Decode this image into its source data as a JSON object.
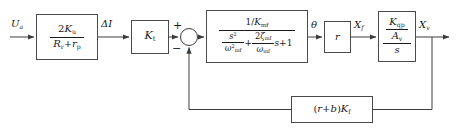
{
  "diagram": {
    "line_color": "#3c3c3c",
    "block_border_color": "#4a4a4a",
    "background": "#ffffff",
    "signals": {
      "input": "U",
      "input_sub": "a",
      "after_first_gain": "ΔI",
      "after_transfer": "θ",
      "after_r": "X",
      "after_r_sub": "f",
      "output": "X",
      "output_sub": "v"
    },
    "summing_junction": {
      "name": "summing-junction",
      "plus_sign": "+",
      "minus_sign": "−"
    },
    "blocks": {
      "gain_ku": {
        "numerator_coeff": "2",
        "numerator_symbol": "K",
        "numerator_sub": "u",
        "den_first_symbol": "R",
        "den_first_sub": "r",
        "den_operator": "+",
        "den_second_symbol": "r",
        "den_second_sub": "p"
      },
      "gain_kt": {
        "symbol": "K",
        "sub": "t"
      },
      "transfer": {
        "numerator_lead": "1/",
        "numerator_symbol": "K",
        "numerator_sub": "mf",
        "den_term1_num": "s",
        "den_term1_num_sup": "2",
        "den_term1_den_symbol": "ω",
        "den_term1_den_sup": "2",
        "den_term1_den_sub": "mf",
        "den_op1": "+",
        "den_term2_num_coeff": "2",
        "den_term2_num_symbol": "ζ",
        "den_term2_num_sub": "mf",
        "den_term2_den_symbol": "ω",
        "den_term2_den_sub": "mf",
        "den_term2_tail": "s",
        "den_op2": "+",
        "den_term3": "1"
      },
      "gain_r": {
        "symbol": "r"
      },
      "integrator": {
        "top_symbol": "K",
        "top_sub": "qp",
        "mid_symbol": "A",
        "mid_sub": "v",
        "bottom_symbol": "s"
      },
      "feedback": {
        "open_paren": "(",
        "term_r": "r",
        "operator": "+",
        "term_b": "b",
        "close_paren": ")",
        "gain_symbol": "K",
        "gain_sub": "f"
      }
    }
  }
}
